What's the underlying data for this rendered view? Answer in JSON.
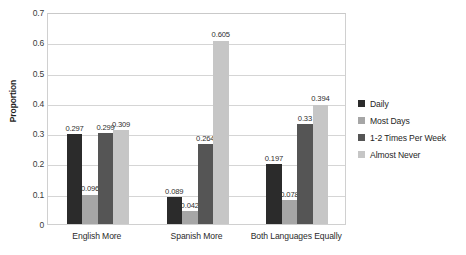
{
  "chart_data": {
    "type": "bar",
    "title": "",
    "subtitle": "",
    "xlabel": "",
    "ylabel": "Proportion",
    "ylim": [
      0,
      0.7
    ],
    "ytick_labels": [
      "0.7",
      "0.6",
      "0.5",
      "0.4",
      "0.3",
      "0.2",
      "0.1",
      "0"
    ],
    "ytick_values": [
      0.7,
      0.6,
      0.5,
      0.4,
      0.3,
      0.2,
      0.1,
      0
    ],
    "grid": "horizontal",
    "legend_position": "right",
    "categories": [
      "English More",
      "Spanish More",
      "Both Languages Equally"
    ],
    "series": [
      {
        "name": "Daily",
        "color": "#2b2b2b",
        "values": [
          0.297,
          0.089,
          0.197
        ],
        "labels": [
          "0.297",
          "0.089",
          "0.197"
        ]
      },
      {
        "name": "Most Days",
        "color": "#a6a6a6",
        "values": [
          0.096,
          0.042,
          0.078
        ],
        "labels": [
          "0.096",
          "0.042",
          "0.078"
        ]
      },
      {
        "name": "1-2 Times Per Week",
        "color": "#555555",
        "values": [
          0.299,
          0.264,
          0.33
        ],
        "labels": [
          "0.299",
          "0.264",
          "0.33"
        ]
      },
      {
        "name": "Almost Never",
        "color": "#c6c6c6",
        "values": [
          0.309,
          0.605,
          0.394
        ],
        "labels": [
          "0.309",
          "0.605",
          "0.394"
        ]
      }
    ]
  }
}
